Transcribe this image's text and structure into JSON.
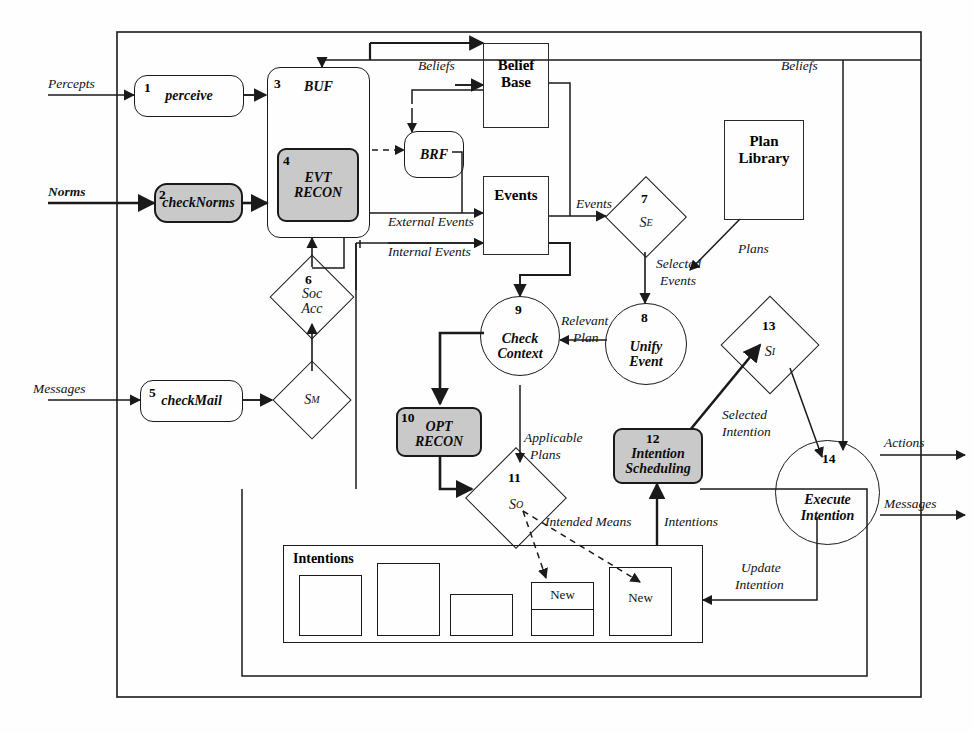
{
  "diagram": {
    "colors": {
      "shaded_fill": "#c9c9c9",
      "stroke": "#1a1a1a",
      "background": "#ffffff"
    },
    "inputs": [
      {
        "id": "percepts",
        "label": "Percepts"
      },
      {
        "id": "norms",
        "label": "Norms"
      },
      {
        "id": "messages",
        "label": "Messages"
      }
    ],
    "outputs": [
      {
        "id": "actions",
        "label": "Actions"
      },
      {
        "id": "messages-out",
        "label": "Messages"
      }
    ],
    "nodes": [
      {
        "id": "perceive",
        "num": "1",
        "label": "perceive",
        "shape": "rounded-rect",
        "shaded": false
      },
      {
        "id": "checknorms",
        "num": "2",
        "label": "checkNorms",
        "shape": "rounded-rect",
        "shaded": true
      },
      {
        "id": "buf",
        "num": "3",
        "label": "BUF",
        "shape": "rounded-rect",
        "shaded": false
      },
      {
        "id": "evtrecon",
        "num": "4",
        "label": "EVT\nRECON",
        "shape": "rounded-rect",
        "shaded": true
      },
      {
        "id": "checkmail",
        "num": "5",
        "label": "checkMail",
        "shape": "rounded-rect",
        "shaded": false
      },
      {
        "id": "socacc",
        "num": "6",
        "label": "Soc\nAcc",
        "shape": "diamond",
        "shaded": false
      },
      {
        "id": "se",
        "num": "7",
        "label": "S_E",
        "shape": "diamond",
        "shaded": false
      },
      {
        "id": "unifyevent",
        "num": "8",
        "label": "Unify\nEvent",
        "shape": "circle",
        "shaded": false
      },
      {
        "id": "checkctx",
        "num": "9",
        "label": "Check\nContext",
        "shape": "circle",
        "shaded": false
      },
      {
        "id": "optrecon",
        "num": "10",
        "label": "OPT\nRECON",
        "shape": "rounded-rect",
        "shaded": true
      },
      {
        "id": "so",
        "num": "11",
        "label": "S_O",
        "shape": "diamond",
        "shaded": false
      },
      {
        "id": "intsched",
        "num": "12",
        "label": "Intention\nScheduling",
        "shape": "rounded-rect",
        "shaded": true
      },
      {
        "id": "si",
        "num": "13",
        "label": "S_I",
        "shape": "diamond",
        "shaded": false
      },
      {
        "id": "execint",
        "num": "14",
        "label": "Execute\nIntention",
        "shape": "circle",
        "shaded": false
      }
    ],
    "node_labels": {
      "perceive": "perceive",
      "checknorms": "checkNorms",
      "buf": "BUF",
      "evtrecon_line1": "EVT",
      "evtrecon_line2": "RECON",
      "brf": "BRF",
      "checkmail": "checkMail",
      "socacc_line1": "Soc",
      "socacc_line2": "Acc",
      "unify_line1": "Unify",
      "unify_line2": "Event",
      "checkctx_line1": "Check",
      "checkctx_line2": "Context",
      "optrecon_line1": "OPT",
      "optrecon_line2": "RECON",
      "intsched_line1": "Intention",
      "intsched_line2": "Scheduling",
      "execint_line1": "Execute",
      "execint_line2": "Intention",
      "se_main": "S",
      "se_sub": "E",
      "so_main": "S",
      "so_sub": "O",
      "si_main": "S",
      "si_sub": "I",
      "sm_main": "S",
      "sm_sub": "M"
    },
    "numbers": {
      "perceive": "1",
      "checknorms": "2",
      "buf": "3",
      "evtrecon": "4",
      "checkmail": "5",
      "socacc": "6",
      "se": "7",
      "unifyevent": "8",
      "checkctx": "9",
      "optrecon": "10",
      "so": "11",
      "intsched": "12",
      "si": "13",
      "execint": "14"
    },
    "stores": [
      {
        "id": "belief-base",
        "line1": "Belief",
        "line2": "Base"
      },
      {
        "id": "events",
        "line1": "Events",
        "line2": ""
      },
      {
        "id": "plan-library",
        "line1": "Plan",
        "line2": "Library"
      },
      {
        "id": "intentions",
        "line1": "Intentions",
        "line2": ""
      }
    ],
    "store_labels": {
      "belief_line1": "Belief",
      "belief_line2": "Base",
      "events": "Events",
      "plan_line1": "Plan",
      "plan_line2": "Library",
      "intentions": "Intentions"
    },
    "intention_items": [
      {
        "id": "intention-1",
        "label": ""
      },
      {
        "id": "intention-2",
        "label": ""
      },
      {
        "id": "intention-3",
        "label": ""
      },
      {
        "id": "intention-4",
        "label": "New"
      },
      {
        "id": "intention-5",
        "label": "New"
      }
    ],
    "intention_new_label": "New",
    "edge_labels": {
      "beliefs_brf": "Beliefs",
      "beliefs_top": "Beliefs",
      "external_events": "External Events",
      "internal_events": "Internal Events",
      "events_to_se": "Events",
      "selected_events_l1": "Selected",
      "selected_events_l2": "Events",
      "relevant_plan_l1": "Relevant",
      "relevant_plan_l2": "Plan",
      "plans": "Plans",
      "applicable_plans_l1": "Applicable",
      "applicable_plans_l2": "Plans",
      "intended_means": "Intended Means",
      "intentions_flow": "Intentions",
      "selected_intention_l1": "Selected",
      "selected_intention_l2": "Intention",
      "update_intention_l1": "Update",
      "update_intention_l2": "Intention"
    }
  }
}
